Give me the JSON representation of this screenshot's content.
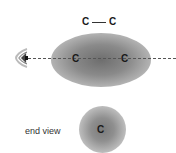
{
  "diagram": {
    "title_bond": {
      "atom_left": "C",
      "atom_right": "C",
      "bond": "single"
    },
    "side_view": {
      "atom_left": "C",
      "atom_right": "C",
      "axis": "dashed line of sight"
    },
    "viewer": {
      "icon": "eye-icon"
    },
    "end_view": {
      "label": "end view",
      "atom": "C"
    },
    "colors": {
      "cloud": "#7a7a7a",
      "axis": "#555555",
      "text": "#1a1a1a"
    }
  }
}
